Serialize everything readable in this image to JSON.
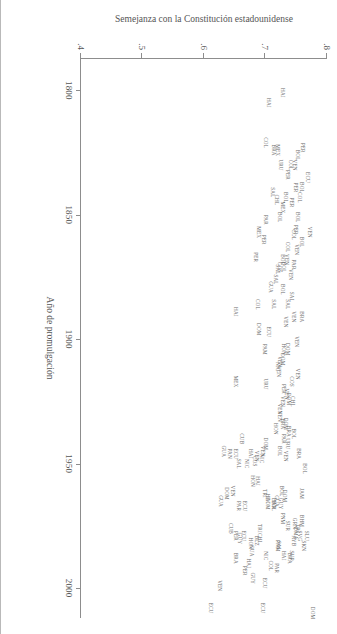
{
  "figure": {
    "background_color": "#ffffff",
    "text_color": "#5a5a5a",
    "orientation_note": "rotated-90-landscape"
  },
  "chart_data": {
    "type": "scatter",
    "title": "",
    "subtitle": "",
    "xlabel": "Año de promulgación",
    "ylabel": "Semejanza con la Constitución estadounidense",
    "xlim": [
      1787,
      2012
    ],
    "ylim": [
      0.4,
      0.8
    ],
    "xticks": [
      1800,
      1850,
      1900,
      1950,
      2000
    ],
    "xtick_labels": [
      "1800",
      "1850",
      "1900",
      "1950",
      "2000"
    ],
    "yticks": [
      0.4,
      0.5,
      0.6,
      0.7,
      0.8
    ],
    "ytick_labels": [
      ".4",
      ".5",
      ".6",
      ".7",
      ".8"
    ],
    "grid": false,
    "legend": null,
    "marker_style": "text-label",
    "annotations": [],
    "points": [
      {
        "label": "HAI",
        "x": 1801,
        "y": 0.727
      },
      {
        "label": "HAI",
        "x": 1805,
        "y": 0.704
      },
      {
        "label": "PER",
        "x": 1823,
        "y": 0.759
      },
      {
        "label": "BOL",
        "x": 1826,
        "y": 0.752
      },
      {
        "label": "URU",
        "x": 1830,
        "y": 0.724
      },
      {
        "label": "VEN",
        "x": 1830,
        "y": 0.747
      },
      {
        "label": "COL",
        "x": 1830,
        "y": 0.74
      },
      {
        "label": "PER",
        "x": 1834,
        "y": 0.735
      },
      {
        "label": "MEX",
        "x": 1824,
        "y": 0.719
      },
      {
        "label": "BRA",
        "x": 1824,
        "y": 0.712
      },
      {
        "label": "COL",
        "x": 1821,
        "y": 0.699
      },
      {
        "label": "ECU",
        "x": 1835,
        "y": 0.768
      },
      {
        "label": "BOL",
        "x": 1839,
        "y": 0.757
      },
      {
        "label": "COL",
        "x": 1843,
        "y": 0.755
      },
      {
        "label": "PER",
        "x": 1839,
        "y": 0.748
      },
      {
        "label": "PER",
        "x": 1845,
        "y": 0.742
      },
      {
        "label": "BOL",
        "x": 1843,
        "y": 0.731
      },
      {
        "label": "MEX",
        "x": 1847,
        "y": 0.727
      },
      {
        "label": "BOL",
        "x": 1851,
        "y": 0.751
      },
      {
        "label": "CHL",
        "x": 1844,
        "y": 0.717
      },
      {
        "label": "SAL",
        "x": 1841,
        "y": 0.711
      },
      {
        "label": "BOL",
        "x": 1851,
        "y": 0.722
      },
      {
        "label": "PAR",
        "x": 1852,
        "y": 0.699
      },
      {
        "label": "VEN",
        "x": 1857,
        "y": 0.771
      },
      {
        "label": "BOL",
        "x": 1861,
        "y": 0.758
      },
      {
        "label": "PER",
        "x": 1856,
        "y": 0.748
      },
      {
        "label": "VEN",
        "x": 1864,
        "y": 0.75
      },
      {
        "label": "COL",
        "x": 1858,
        "y": 0.744
      },
      {
        "label": "COL",
        "x": 1863,
        "y": 0.735
      },
      {
        "label": "VEN",
        "x": 1868,
        "y": 0.733
      },
      {
        "label": "BOL",
        "x": 1868,
        "y": 0.727
      },
      {
        "label": "PER",
        "x": 1860,
        "y": 0.696
      },
      {
        "label": "MEX",
        "x": 1857,
        "y": 0.687
      },
      {
        "label": "PAR",
        "x": 1870,
        "y": 0.744
      },
      {
        "label": "VEN",
        "x": 1874,
        "y": 0.74
      },
      {
        "label": "BOL",
        "x": 1871,
        "y": 0.728
      },
      {
        "label": "COS",
        "x": 1871,
        "y": 0.722
      },
      {
        "label": "SAL",
        "x": 1872,
        "y": 0.719
      },
      {
        "label": "SAL",
        "x": 1876,
        "y": 0.715
      },
      {
        "label": "GUA",
        "x": 1879,
        "y": 0.707
      },
      {
        "label": "PER",
        "x": 1867,
        "y": 0.683
      },
      {
        "label": "BRA",
        "x": 1891,
        "y": 0.758
      },
      {
        "label": "VEN",
        "x": 1891,
        "y": 0.745
      },
      {
        "label": "SAL",
        "x": 1883,
        "y": 0.741
      },
      {
        "label": "SAL",
        "x": 1886,
        "y": 0.735
      },
      {
        "label": "BOL",
        "x": 1880,
        "y": 0.727
      },
      {
        "label": "VEN",
        "x": 1893,
        "y": 0.732
      },
      {
        "label": "SAL",
        "x": 1886,
        "y": 0.712
      },
      {
        "label": "COL",
        "x": 1886,
        "y": 0.686
      },
      {
        "label": "HAI",
        "x": 1889,
        "y": 0.651
      },
      {
        "label": "ECU",
        "x": 1897,
        "y": 0.704
      },
      {
        "label": "DOM",
        "x": 1896,
        "y": 0.687
      },
      {
        "label": "VEN",
        "x": 1901,
        "y": 0.749
      },
      {
        "label": "DOM",
        "x": 1904,
        "y": 0.735
      },
      {
        "label": "HON",
        "x": 1904,
        "y": 0.729
      },
      {
        "label": "VEN",
        "x": 1909,
        "y": 0.722
      },
      {
        "label": "DOM",
        "x": 1908,
        "y": 0.727
      },
      {
        "label": "NIC",
        "x": 1911,
        "y": 0.718
      },
      {
        "label": "VEN",
        "x": 1913,
        "y": 0.72
      },
      {
        "label": "PAM",
        "x": 1904,
        "y": 0.698
      },
      {
        "label": "VEN",
        "x": 1914,
        "y": 0.752
      },
      {
        "label": "COS",
        "x": 1917,
        "y": 0.741
      },
      {
        "label": "CHL",
        "x": 1925,
        "y": 0.743
      },
      {
        "label": "DOM",
        "x": 1924,
        "y": 0.737
      },
      {
        "label": "VEN",
        "x": 1922,
        "y": 0.733
      },
      {
        "label": "PER",
        "x": 1920,
        "y": 0.729
      },
      {
        "label": "VEN",
        "x": 1925,
        "y": 0.727
      },
      {
        "label": "VEN",
        "x": 1928,
        "y": 0.722
      },
      {
        "label": "URU",
        "x": 1918,
        "y": 0.7
      },
      {
        "label": "MEX",
        "x": 1917,
        "y": 0.651
      },
      {
        "label": "BOL",
        "x": 1938,
        "y": 0.744
      },
      {
        "label": "BRA",
        "x": 1937,
        "y": 0.737
      },
      {
        "label": "DOM",
        "x": 1934,
        "y": 0.731
      },
      {
        "label": "BRA",
        "x": 1934,
        "y": 0.727
      },
      {
        "label": "VEN",
        "x": 1931,
        "y": 0.722
      },
      {
        "label": "HON",
        "x": 1936,
        "y": 0.716
      },
      {
        "label": "BRA",
        "x": 1946,
        "y": 0.753
      },
      {
        "label": "PAR",
        "x": 1940,
        "y": 0.728
      },
      {
        "label": "BOL",
        "x": 1945,
        "y": 0.722
      },
      {
        "label": "URU",
        "x": 1942,
        "y": 0.735
      },
      {
        "label": "VEN",
        "x": 1947,
        "y": 0.732
      },
      {
        "label": "BOL",
        "x": 1952,
        "y": 0.762
      },
      {
        "label": "DOM",
        "x": 1942,
        "y": 0.7
      },
      {
        "label": "VEN",
        "x": 1945,
        "y": 0.694
      },
      {
        "label": "NIC",
        "x": 1948,
        "y": 0.692
      },
      {
        "label": "VEN",
        "x": 1947,
        "y": 0.684
      },
      {
        "label": "COS",
        "x": 1949,
        "y": 0.682
      },
      {
        "label": "HAI",
        "x": 1946,
        "y": 0.675
      },
      {
        "label": "NIC",
        "x": 1950,
        "y": 0.668
      },
      {
        "label": "CUB",
        "x": 1940,
        "y": 0.66
      },
      {
        "label": "ECU",
        "x": 1946,
        "y": 0.65
      },
      {
        "label": "SAL",
        "x": 1950,
        "y": 0.655
      },
      {
        "label": "PAN",
        "x": 1946,
        "y": 0.64
      },
      {
        "label": "GUA",
        "x": 1945,
        "y": 0.631
      },
      {
        "label": "JAM",
        "x": 1962,
        "y": 0.757
      },
      {
        "label": "BOL",
        "x": 1961,
        "y": 0.726
      },
      {
        "label": "DOM",
        "x": 1963,
        "y": 0.73
      },
      {
        "label": "GUA",
        "x": 1965,
        "y": 0.717
      },
      {
        "label": "GUY",
        "x": 1966,
        "y": 0.723
      },
      {
        "label": "BOL",
        "x": 1967,
        "y": 0.712
      },
      {
        "label": "BAR",
        "x": 1966,
        "y": 0.713
      },
      {
        "label": "HAI",
        "x": 1964,
        "y": 0.703
      },
      {
        "label": "DOM",
        "x": 1966,
        "y": 0.703
      },
      {
        "label": "TRI",
        "x": 1962,
        "y": 0.697
      },
      {
        "label": "HAI",
        "x": 1957,
        "y": 0.686
      },
      {
        "label": "HON",
        "x": 1957,
        "y": 0.678
      },
      {
        "label": "TRI",
        "x": 1976,
        "y": 0.69
      },
      {
        "label": "ECU",
        "x": 1967,
        "y": 0.665
      },
      {
        "label": "PAR",
        "x": 1967,
        "y": 0.655
      },
      {
        "label": "VEN",
        "x": 1961,
        "y": 0.645
      },
      {
        "label": "DOM",
        "x": 1962,
        "y": 0.636
      },
      {
        "label": "GUA",
        "x": 1965,
        "y": 0.626
      },
      {
        "label": "SLU",
        "x": 1979,
        "y": 0.766
      },
      {
        "label": "BHM",
        "x": 1973,
        "y": 0.758
      },
      {
        "label": "SKN",
        "x": 1983,
        "y": 0.761
      },
      {
        "label": "TRI",
        "x": 1976,
        "y": 0.752
      },
      {
        "label": "SVG",
        "x": 1979,
        "y": 0.754
      },
      {
        "label": "GRN",
        "x": 1974,
        "y": 0.746
      },
      {
        "label": "DMA",
        "x": 1978,
        "y": 0.748
      },
      {
        "label": "BRA",
        "x": 1988,
        "y": 0.738
      },
      {
        "label": "SUR",
        "x": 1987,
        "y": 0.741
      },
      {
        "label": "AYB",
        "x": 1981,
        "y": 0.744
      },
      {
        "label": "SUR",
        "x": 1975,
        "y": 0.735
      },
      {
        "label": "PNM",
        "x": 1972,
        "y": 0.727
      },
      {
        "label": "HAI",
        "x": 1987,
        "y": 0.728
      },
      {
        "label": "PNM",
        "x": 1983,
        "y": 0.718
      },
      {
        "label": "SAL",
        "x": 1983,
        "y": 0.72
      },
      {
        "label": "PAR",
        "x": 1992,
        "y": 0.717
      },
      {
        "label": "DOM",
        "x": 2010,
        "y": 0.776
      },
      {
        "label": "CHL",
        "x": 1980,
        "y": 0.69
      },
      {
        "label": "NIC",
        "x": 1987,
        "y": 0.7
      },
      {
        "label": "BLZ",
        "x": 1981,
        "y": 0.684
      },
      {
        "label": "COL",
        "x": 1991,
        "y": 0.707
      },
      {
        "label": "GUA",
        "x": 1985,
        "y": 0.676
      },
      {
        "label": "ECU",
        "x": 1979,
        "y": 0.663
      },
      {
        "label": "HON",
        "x": 1982,
        "y": 0.675
      },
      {
        "label": "ECU",
        "x": 1998,
        "y": 0.698
      },
      {
        "label": "GUY",
        "x": 1980,
        "y": 0.657
      },
      {
        "label": "PER",
        "x": 1979,
        "y": 0.65
      },
      {
        "label": "GUY",
        "x": 1996,
        "y": 0.678
      },
      {
        "label": "HAI",
        "x": 1990,
        "y": 0.672
      },
      {
        "label": "ECU",
        "x": 2008,
        "y": 0.694
      },
      {
        "label": "CUB",
        "x": 1976,
        "y": 0.643
      },
      {
        "label": "PER",
        "x": 1993,
        "y": 0.665
      },
      {
        "label": "BRA",
        "x": 1988,
        "y": 0.65
      },
      {
        "label": "VEN",
        "x": 1999,
        "y": 0.625
      },
      {
        "label": "ECU",
        "x": 2008,
        "y": 0.61
      }
    ]
  }
}
